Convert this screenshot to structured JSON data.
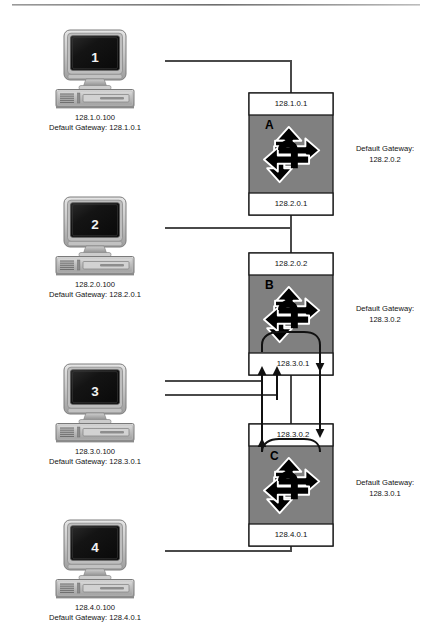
{
  "diagram": {
    "type": "network-topology",
    "colors": {
      "router_fill": "#808080",
      "router_band": "#ffffff",
      "router_stroke": "#1a1a1a",
      "link": "#4a4a4a",
      "flow_arrow": "#000000",
      "monitor_screen": "#151515",
      "case_light": "#d9d9d9",
      "case_mid": "#b5b5b5",
      "case_dark": "#8e8e8e",
      "rule": "#808080"
    },
    "top_rule": true
  },
  "hosts": [
    {
      "id": "host-1",
      "number": "1",
      "ip": "128.1.0.100",
      "gateway_line": "Default Gateway: 128.1.0.1",
      "x": 95,
      "y": 30
    },
    {
      "id": "host-2",
      "number": "2",
      "ip": "128.2.0.100",
      "gateway_line": "Default Gateway: 128.2.0.1",
      "x": 95,
      "y": 197
    },
    {
      "id": "host-3",
      "number": "3",
      "ip": "128.3.0.100",
      "gateway_line": "Default Gateway: 128.3.0.1",
      "x": 95,
      "y": 364
    },
    {
      "id": "host-4",
      "number": "4",
      "ip": "128.4.0.100",
      "gateway_line": "Default Gateway: 128.4.0.1",
      "x": 95,
      "y": 520
    }
  ],
  "routers": [
    {
      "id": "router-a",
      "letter": "A",
      "top_interface": "128.1.0.1",
      "bottom_interface": "128.2.0.1",
      "gateway_label_line1": "Default Gateway:",
      "gateway_label_line2": "128.2.0.2",
      "x": 249,
      "y": 93,
      "w": 84,
      "h": 122
    },
    {
      "id": "router-b",
      "letter": "B",
      "top_interface": "128.2.0.2",
      "bottom_interface": "128.3.0.1",
      "gateway_label_line1": "Default Gateway:",
      "gateway_label_line2": "128.3.0.2",
      "x": 249,
      "y": 253,
      "w": 84,
      "h": 122
    },
    {
      "id": "router-c",
      "letter": "C",
      "top_interface": "128.3.0.2",
      "bottom_interface": "128.4.0.1",
      "gateway_label_line1": "Default Gateway:",
      "gateway_label_line2": "128.3.0.1",
      "x": 249,
      "y": 424,
      "w": 84,
      "h": 122
    }
  ],
  "links": [
    {
      "id": "link-host1-routerA",
      "from": "host-1",
      "to": "router-a",
      "interface": "128.1.0.1"
    },
    {
      "id": "link-host2-routerA",
      "from": "host-2",
      "to": "router-a",
      "interface": "128.2.0.1"
    },
    {
      "id": "link-host2-routerB",
      "from": "host-2",
      "to": "router-b",
      "interface": "128.2.0.2"
    },
    {
      "id": "link-host3-routerB",
      "from": "host-3",
      "to": "router-b",
      "interface": "128.3.0.1"
    },
    {
      "id": "link-host3-routerC",
      "from": "host-3",
      "to": "router-c",
      "interface": "128.3.0.2"
    },
    {
      "id": "link-host4-routerC",
      "from": "host-4",
      "to": "router-c",
      "interface": "128.4.0.1"
    }
  ],
  "traffic_flows": [
    {
      "id": "flow-down-b-to-c",
      "direction": "down",
      "from_interface": "128.3.0.1",
      "to_interface": "128.3.0.2"
    },
    {
      "id": "flow-up-c-to-b",
      "direction": "up",
      "from_interface": "128.3.0.2",
      "to_interface": "128.3.0.1"
    }
  ]
}
